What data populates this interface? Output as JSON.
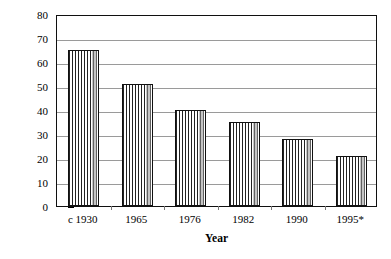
{
  "chart_data": {
    "type": "bar",
    "title": "",
    "subtitle": "",
    "xlabel": "Year",
    "ylabel": "Space heat GJ/a",
    "categories": [
      "c 1930",
      "1965",
      "1976",
      "1982",
      "1990",
      "1995*"
    ],
    "values": [
      65,
      51,
      40,
      35,
      28,
      21
    ],
    "series": [
      {
        "name": "Space heat",
        "values": [
          65,
          51,
          40,
          35,
          28,
          21
        ]
      }
    ],
    "ylim": [
      0,
      80
    ],
    "y_ticks": [
      0,
      10,
      20,
      30,
      40,
      50,
      60,
      70,
      80
    ],
    "y_tick_labels": [
      "0",
      "10",
      "20",
      "30",
      "40",
      "50",
      "60",
      "70",
      "80"
    ],
    "grid": true,
    "grid_axis": "y",
    "legend": false,
    "legend_position": "none",
    "bar_fill": "vertical-hatch",
    "bar_edge_color": "#111111",
    "bar_fill_color": "#ffffff",
    "gridline_color": "#9a9a9a",
    "frame_color": "#101010",
    "background_color": "#ffffff",
    "annotations": [],
    "footnote_marker": "*"
  }
}
